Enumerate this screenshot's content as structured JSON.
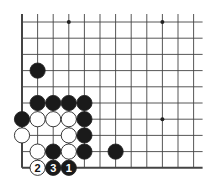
{
  "diagram": {
    "type": "go-board-problem",
    "board_region": "lower-left corner",
    "grid": {
      "columns": 12,
      "rows": 10,
      "origin_x": 22,
      "origin_y": 22,
      "step_x": 15.6,
      "step_y": 16.2,
      "left_edge": true,
      "bottom_edge": true,
      "top_open": true,
      "right_open": true
    },
    "colors": {
      "line": "#444444",
      "black_stone": "#1a1a1a",
      "white_stone": "#ffffff",
      "stone_outline": "#222222"
    },
    "star_points": [
      {
        "col": 3,
        "row": 0
      },
      {
        "col": 9,
        "row": 0
      },
      {
        "col": 9,
        "row": 6
      }
    ],
    "stones": [
      {
        "col": 1,
        "row": 3,
        "color": "black"
      },
      {
        "col": 1,
        "row": 5,
        "color": "black"
      },
      {
        "col": 2,
        "row": 5,
        "color": "black"
      },
      {
        "col": 3,
        "row": 5,
        "color": "black"
      },
      {
        "col": 4,
        "row": 5,
        "color": "black"
      },
      {
        "col": 0,
        "row": 6,
        "color": "black"
      },
      {
        "col": 1,
        "row": 6,
        "color": "white"
      },
      {
        "col": 2,
        "row": 6,
        "color": "white"
      },
      {
        "col": 3,
        "row": 6,
        "color": "white"
      },
      {
        "col": 4,
        "row": 6,
        "color": "black"
      },
      {
        "col": 0,
        "row": 7,
        "color": "white"
      },
      {
        "col": 3,
        "row": 7,
        "color": "white"
      },
      {
        "col": 4,
        "row": 7,
        "color": "black"
      },
      {
        "col": 1,
        "row": 8,
        "color": "white"
      },
      {
        "col": 2,
        "row": 8,
        "color": "black"
      },
      {
        "col": 3,
        "row": 8,
        "color": "white"
      },
      {
        "col": 4,
        "row": 8,
        "color": "black"
      },
      {
        "col": 6,
        "row": 8,
        "color": "black"
      },
      {
        "col": 1,
        "row": 9,
        "color": "white",
        "label": "2"
      },
      {
        "col": 2,
        "row": 9,
        "color": "black",
        "label": "3"
      },
      {
        "col": 3,
        "row": 9,
        "color": "black",
        "label": "1"
      }
    ]
  }
}
